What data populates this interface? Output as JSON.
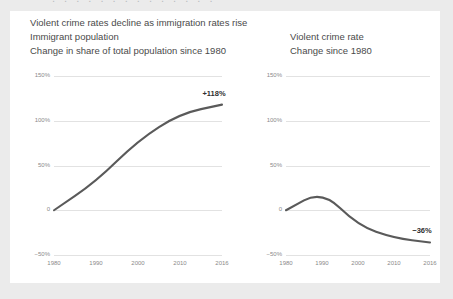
{
  "clipped_top_text": ". . . . . . . . . . . . . .",
  "headline": "Violent crime rates decline as immigration rates rise",
  "left_panel": {
    "title": "Immigrant population",
    "subtitle": "Change in share of total population since 1980"
  },
  "right_panel": {
    "title": "Violent crime rate",
    "subtitle": "Change since 1980"
  },
  "colors": {
    "line": "#5a5a5a",
    "grid": "#e2e2e2",
    "text": "#4a4a4a",
    "tick": "#8a8a8a",
    "card_background": "#ffffff",
    "page_background": "#ebebeb"
  },
  "chart_data": [
    {
      "type": "line",
      "title": "Immigrant population",
      "subtitle": "Change in share of total population since 1980",
      "xlabel": "",
      "ylabel": "",
      "x": [
        1980,
        1990,
        2000,
        2010,
        2016
      ],
      "categories": [
        "1980",
        "1990",
        "2000",
        "2010",
        "2016"
      ],
      "values": [
        0,
        32,
        78,
        108,
        118
      ],
      "ylim": [
        -50,
        150
      ],
      "yticks": [
        150,
        100,
        50,
        0,
        -50
      ],
      "ytick_labels": [
        "150%",
        "100%",
        "50%",
        "0",
        "−50%"
      ],
      "grid": true,
      "legend": "none",
      "annotations": [
        {
          "text": "+118%",
          "x": 2016,
          "y": 118
        }
      ]
    },
    {
      "type": "line",
      "title": "Violent crime rate",
      "subtitle": "Change since 1980",
      "xlabel": "",
      "ylabel": "",
      "x": [
        1980,
        1990,
        2000,
        2010,
        2016
      ],
      "categories": [
        "1980",
        "1990",
        "2000",
        "2010",
        "2016"
      ],
      "values": [
        0,
        22,
        -17,
        -31,
        -36
      ],
      "ylim": [
        -50,
        150
      ],
      "yticks": [
        150,
        100,
        50,
        0,
        -50
      ],
      "ytick_labels": [
        "150%",
        "100%",
        "50%",
        "0",
        "−50%"
      ],
      "grid": true,
      "legend": "none",
      "annotations": [
        {
          "text": "−36%",
          "x": 2016,
          "y": -36
        }
      ]
    }
  ]
}
